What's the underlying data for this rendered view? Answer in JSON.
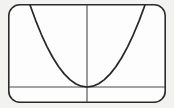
{
  "figure": {
    "title": "",
    "background_color": "#f2f2f0",
    "panel_color": "#fdfdfd",
    "frame": {
      "name": "rounded-rectangle-frame",
      "x": 8,
      "y": 4,
      "width": 158,
      "height": 99,
      "corner_radius": 11,
      "stroke_color": "#2b2b2b",
      "stroke_width": 1.6
    },
    "axes": {
      "x_axis": {
        "label": "",
        "y_pixel": 87,
        "x_start_pixel": 9,
        "x_end_pixel": 165,
        "color": "#4a4a4a"
      },
      "y_axis": {
        "label": "",
        "x_pixel": 87,
        "y_start_pixel": 5,
        "y_end_pixel": 102,
        "color": "#4a4a4a"
      },
      "origin_pixel": [
        87,
        87
      ]
    }
  },
  "chart_data": {
    "type": "line",
    "title": "",
    "subtitle": "",
    "xlabel": "",
    "ylabel": "",
    "grid": false,
    "legend": [],
    "legend_position": "none",
    "annotations": [],
    "xlim": [
      -1.0,
      1.0
    ],
    "ylim": [
      0.0,
      1.0
    ],
    "xticks": [],
    "yticks": [],
    "series": [
      {
        "name": "parabola",
        "equation": "y = x^2",
        "color": "#262626",
        "line_width": 1.7,
        "vertex": [
          0.0,
          0.0
        ],
        "x": [
          -1.0,
          -0.9,
          -0.8,
          -0.7,
          -0.6,
          -0.5,
          -0.4,
          -0.3,
          -0.2,
          -0.1,
          0.0,
          0.1,
          0.2,
          0.3,
          0.4,
          0.5,
          0.6,
          0.7,
          0.8,
          0.9,
          1.0
        ],
        "values": [
          1.0,
          0.81,
          0.64,
          0.49,
          0.36,
          0.25,
          0.16,
          0.09,
          0.04,
          0.01,
          0.0,
          0.01,
          0.04,
          0.09,
          0.16,
          0.25,
          0.36,
          0.49,
          0.64,
          0.81,
          1.0
        ]
      }
    ]
  },
  "curve_geometry": {
    "name": "parabola-path",
    "left_endpoint_pixel": [
      30,
      5
    ],
    "right_endpoint_pixel": [
      145,
      5
    ],
    "vertex_pixel": [
      87,
      87
    ],
    "path": "M 30 5 Q 87 168 145 5"
  }
}
